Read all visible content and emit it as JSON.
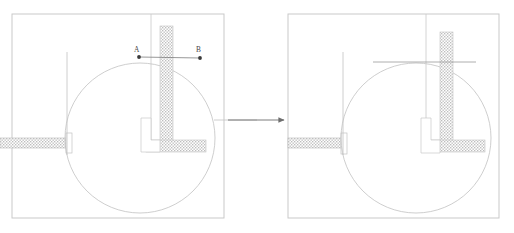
{
  "figure": {
    "kind": "engineering-cad-diagram",
    "background_color": "#ffffff",
    "line_color": "#b9b9b9",
    "dark_line_color": "#6e6e6e",
    "hatch_color": "#bdbdbd",
    "label_color": "#4a4a4a",
    "arrow_color": "#808080"
  },
  "panels": [
    {
      "id": "left-panel",
      "name": "before-view",
      "frame": {
        "x": 12,
        "y": 14,
        "w": 212,
        "h": 204
      },
      "circle": {
        "cx": 140,
        "cy": 138,
        "r": 75
      },
      "column": {
        "x": 160,
        "y": 26,
        "w": 13,
        "h": 126
      },
      "footing": {
        "x": 146,
        "y": 140,
        "w": 60,
        "h": 12
      },
      "left_beam": {
        "x": 0,
        "y": 138,
        "w": 66,
        "h": 10
      },
      "beam_cap": {
        "x": 66,
        "y": 134,
        "w": 6,
        "h": 18
      },
      "inner_step": {
        "x": 141,
        "y": 118,
        "w": 10,
        "h": 22
      },
      "vertical_axis_inner": {
        "x": 67,
        "y1": 52,
        "y2": 155
      },
      "vertical_axis_column": {
        "x": 151,
        "y1": 14,
        "y2": 148
      },
      "right_tick": {
        "x1": 215,
        "x2": 257,
        "y": 120
      },
      "measure_line": {
        "x1": 139,
        "y1": 57,
        "x2": 200,
        "y2": 58
      },
      "points": [
        {
          "label": "A",
          "x": 139,
          "y": 57,
          "label_dx": -6,
          "label_dy": -4
        },
        {
          "label": "B",
          "x": 200,
          "y": 58,
          "label_dx": -4,
          "label_dy": -5
        }
      ]
    },
    {
      "id": "right-panel",
      "name": "after-view",
      "frame": {
        "x": 288,
        "y": 14,
        "w": 211,
        "h": 204
      },
      "circle": {
        "cx": 416,
        "cy": 138,
        "r": 75
      },
      "column": {
        "x": 440,
        "y": 32,
        "w": 13,
        "h": 120
      },
      "footing": {
        "x": 426,
        "y": 140,
        "w": 59,
        "h": 12
      },
      "left_beam": {
        "x": 288,
        "y": 138,
        "w": 66,
        "h": 10
      },
      "beam_cap": {
        "x": 341,
        "y": 134,
        "w": 6,
        "h": 20
      },
      "inner_step": {
        "x": 421,
        "y": 118,
        "w": 10,
        "h": 22
      },
      "vertical_axis_inner": {
        "x": 343,
        "y1": 52,
        "y2": 155
      },
      "vertical_axis_column": {
        "x": 426,
        "y1": 14,
        "y2": 153
      },
      "cut_line": {
        "x1": 373,
        "x2": 475,
        "y": 62
      },
      "points": []
    }
  ],
  "arrow": {
    "name": "transition-arrow",
    "x1": 228,
    "x2": 284,
    "y": 120,
    "head_size": 6
  }
}
